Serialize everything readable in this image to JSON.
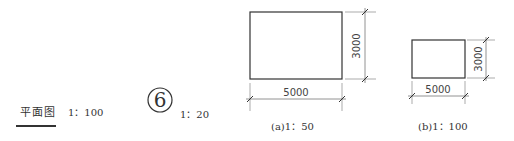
{
  "plan_label": {
    "title": "平面图",
    "scale": "1：100"
  },
  "detail_index": {
    "number": "6",
    "scale": "1：20"
  },
  "drawings": [
    {
      "caption": "(a)1：50",
      "width_dimension": "5000",
      "height_dimension": "3000"
    },
    {
      "caption": "(b)1：100",
      "width_dimension": "5000",
      "height_dimension": "3000"
    }
  ],
  "colors": {
    "line": "#333333",
    "dim_line": "#777777",
    "background": "#ffffff"
  }
}
